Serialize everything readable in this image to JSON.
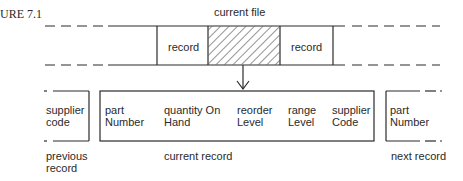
{
  "figure": {
    "label": "URE 7.1",
    "title": "current file"
  },
  "file_strip": {
    "cells": [
      {
        "label": "record",
        "state": "normal"
      },
      {
        "label": "",
        "state": "hatched-current"
      },
      {
        "label": "record",
        "state": "normal"
      }
    ]
  },
  "records": {
    "previous": {
      "fields": [
        {
          "line1": "supplier",
          "line2": "code"
        }
      ],
      "caption_line1": "previous",
      "caption_line2": "record"
    },
    "current": {
      "fields": [
        {
          "line1": "part",
          "line2": "Number"
        },
        {
          "line1": "quantity On",
          "line2": "Hand"
        },
        {
          "line1": "reorder",
          "line2": "Level"
        },
        {
          "line1": "range",
          "line2": "Level"
        },
        {
          "line1": "supplier",
          "line2": "Code"
        }
      ],
      "caption": "current record"
    },
    "next": {
      "fields": [
        {
          "line1": "part",
          "line2": "Number"
        }
      ],
      "caption": "next record"
    }
  },
  "colors": {
    "line": "#2a2a2a",
    "background": "#ffffff"
  }
}
